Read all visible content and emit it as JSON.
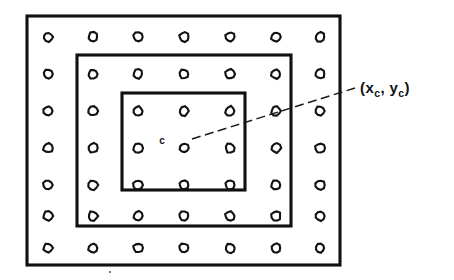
{
  "figure": {
    "background_color": "#ffffff",
    "ink_color": "#101010",
    "width": 454,
    "height": 280,
    "center_marker_label": "c",
    "coordinate_label": "(x",
    "coordinate_label_sub1": "c",
    "coordinate_label_mid": ", y",
    "coordinate_label_sub2": "c",
    "coordinate_label_end": ")",
    "coordinate_label_full": "(xc, yc)"
  },
  "chart_data": {
    "type": "scatter",
    "xlabel": "",
    "ylabel": "",
    "grid": false,
    "legend": "none",
    "xlim": [
      0,
      454
    ],
    "ylim": [
      280,
      0
    ],
    "grid_points": {
      "rows": 7,
      "cols": 7,
      "marker": "open-circle",
      "radius": 4.6,
      "x": [
        48,
        93,
        138,
        184,
        230,
        276,
        320
      ],
      "y": [
        37,
        74,
        111,
        148,
        185,
        216,
        248
      ]
    },
    "rectangles": [
      {
        "name": "outer-window",
        "x": 27,
        "y": 16,
        "width": 313,
        "height": 249
      },
      {
        "name": "middle-window",
        "x": 77,
        "y": 55,
        "width": 214,
        "height": 171
      },
      {
        "name": "inner-window",
        "x": 122,
        "y": 93,
        "width": 123,
        "height": 97
      }
    ],
    "center_point": {
      "x": 184,
      "y": 141,
      "label": "c"
    },
    "annotation": {
      "text": "(xc, yc)",
      "line_from": [
        192,
        139
      ],
      "line_to": [
        355,
        88
      ],
      "text_anchor": [
        360,
        93
      ]
    }
  }
}
